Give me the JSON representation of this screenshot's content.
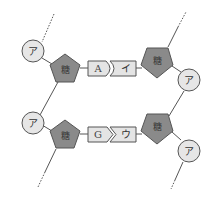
{
  "diagram": {
    "colors": {
      "phosphate_fill": "#e6e6e6",
      "sugar_fill": "#8a8a8a",
      "base_fill": "#e4e4e4",
      "stroke": "#555555"
    },
    "labels": {
      "phosphate": "ア",
      "sugar": "糖",
      "base_pair_1_left": "A",
      "base_pair_1_right": "イ",
      "base_pair_2_left": "G",
      "base_pair_2_right": "ウ"
    },
    "nodes": {
      "top_left_phosphate": "ア",
      "top_left_sugar": "糖",
      "top_right_sugar": "糖",
      "top_right_phosphate": "ア",
      "bottom_left_phosphate": "ア",
      "bottom_left_sugar": "糖",
      "bottom_right_sugar": "糖",
      "bottom_right_phosphate": "ア"
    }
  }
}
